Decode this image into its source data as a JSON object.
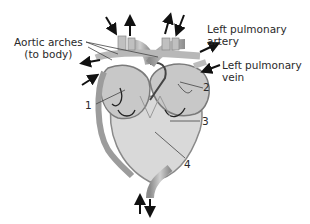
{
  "diagram": {
    "labels": {
      "aortic_arches_line1": "Aortic arches",
      "aortic_arches_line2": "(to body)",
      "left_pulmonary_artery_line1": "Left pulmonary",
      "left_pulmonary_artery_line2": "artery",
      "left_pulmonary_vein_line1": "Left pulmonary",
      "left_pulmonary_vein_line2": "vein"
    },
    "numbers": [
      "1",
      "2",
      "3",
      "4"
    ],
    "colors": {
      "heart_fill": "#d6d6d6",
      "vessel": "#a8a8a8",
      "outline": "#7a7a7a",
      "arrow": "#111111",
      "text": "#2a2a2a"
    }
  }
}
